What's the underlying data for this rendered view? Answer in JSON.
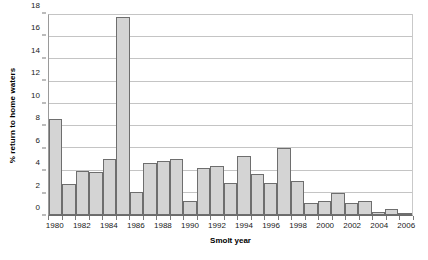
{
  "chart_data": {
    "type": "bar",
    "title": "",
    "xlabel": "Smolt year",
    "ylabel": "% return to home waters",
    "ylim": [
      0,
      18
    ],
    "ytick_step": 2,
    "yticks": [
      0,
      2,
      4,
      6,
      8,
      10,
      12,
      14,
      16,
      18
    ],
    "ytick_labels": [
      "0",
      "2",
      "4",
      "6",
      "8",
      "10",
      "12",
      "14",
      "16",
      "18"
    ],
    "xtick_labels": [
      "1980",
      "1982",
      "1984",
      "1986",
      "1988",
      "1990",
      "1992",
      "1994",
      "1996",
      "1998",
      "2000",
      "2002",
      "2004",
      "2006"
    ],
    "xtick_step": 2,
    "grid": true,
    "grid_axis": "y",
    "legend": false,
    "legend_position": "none",
    "bar_fill": "#d4d4d4",
    "bar_edge": "#6e6e6e",
    "categories": [
      "1980",
      "1981",
      "1982",
      "1983",
      "1984",
      "1985",
      "1986",
      "1987",
      "1988",
      "1989",
      "1990",
      "1991",
      "1992",
      "1993",
      "1994",
      "1995",
      "1996",
      "1997",
      "1998",
      "1999",
      "2000",
      "2001",
      "2002",
      "2003",
      "2004",
      "2005",
      "2006"
    ],
    "values": [
      8.6,
      2.8,
      4.0,
      3.9,
      5.0,
      17.8,
      2.1,
      4.7,
      4.9,
      5.0,
      1.3,
      4.2,
      4.4,
      2.9,
      5.3,
      3.7,
      2.9,
      6.0,
      3.1,
      1.1,
      1.3,
      2.0,
      1.1,
      1.3,
      0.3,
      0.5,
      0.2
    ]
  }
}
